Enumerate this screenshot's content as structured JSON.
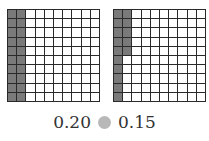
{
  "grids": [
    {
      "id": "grid-a",
      "rows": 10,
      "cols": 10,
      "shaded_count": 20,
      "value": "0.20",
      "shading": "first 2 full columns"
    },
    {
      "id": "grid-b",
      "rows": 10,
      "cols": 10,
      "shaded_count": 15,
      "value": "0.15",
      "shading": "first column full plus top 5 of second column"
    }
  ],
  "caption": {
    "left_value": "0.20",
    "comparison_symbol": "blank-circle",
    "right_value": "0.15"
  },
  "colors": {
    "shaded": "#7a7a7a",
    "grid_line": "#2a2a2a",
    "circle": "#b8b8b8"
  }
}
